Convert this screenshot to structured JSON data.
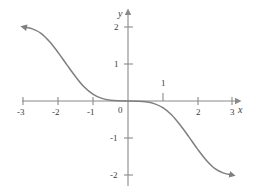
{
  "figure": {
    "background_color": "#ffffff",
    "axis_color": "#8a8a8a",
    "curve_color": "#7f7f7f",
    "label_color": "#3a3a3a",
    "origin_label": "0",
    "x_axis_name": "x",
    "y_axis_name": "y"
  },
  "chart_data": {
    "type": "line",
    "title": "",
    "xlabel": "x",
    "ylabel": "y",
    "xlim": [
      -3.3,
      3.3
    ],
    "ylim": [
      -2.4,
      2.4
    ],
    "grid": false,
    "legend": null,
    "x_ticks": [
      -3,
      -2,
      -1,
      1,
      2,
      3
    ],
    "x_tick_labels": [
      "-3",
      "-2",
      "-1",
      "1",
      "2",
      "3"
    ],
    "y_ticks": [
      2,
      1,
      -1,
      -2
    ],
    "y_tick_labels": [
      "2",
      "1",
      "-1",
      "-2"
    ],
    "origin_label": "0",
    "series": [
      {
        "name": "curve",
        "color": "#7f7f7f",
        "start_marker": "arrow",
        "end_marker": "arrow",
        "x": [
          -3.0,
          -2.75,
          -2.5,
          -2.25,
          -2.0,
          -1.75,
          -1.5,
          -1.25,
          -1.0,
          -0.75,
          -0.5,
          -0.25,
          0.0,
          0.25,
          0.5,
          0.75,
          1.0,
          1.25,
          1.5,
          1.75,
          2.0,
          2.25,
          2.5,
          2.75,
          3.0
        ],
        "y": [
          2.0,
          1.95,
          1.83,
          1.6,
          1.3,
          0.97,
          0.65,
          0.37,
          0.18,
          0.07,
          0.02,
          0.005,
          0.0,
          -0.005,
          -0.02,
          -0.07,
          -0.18,
          -0.37,
          -0.65,
          -0.97,
          -1.3,
          -1.6,
          -1.83,
          -1.95,
          -2.0
        ]
      }
    ]
  },
  "annotations": {
    "x_tick_1_above_axis": true
  }
}
